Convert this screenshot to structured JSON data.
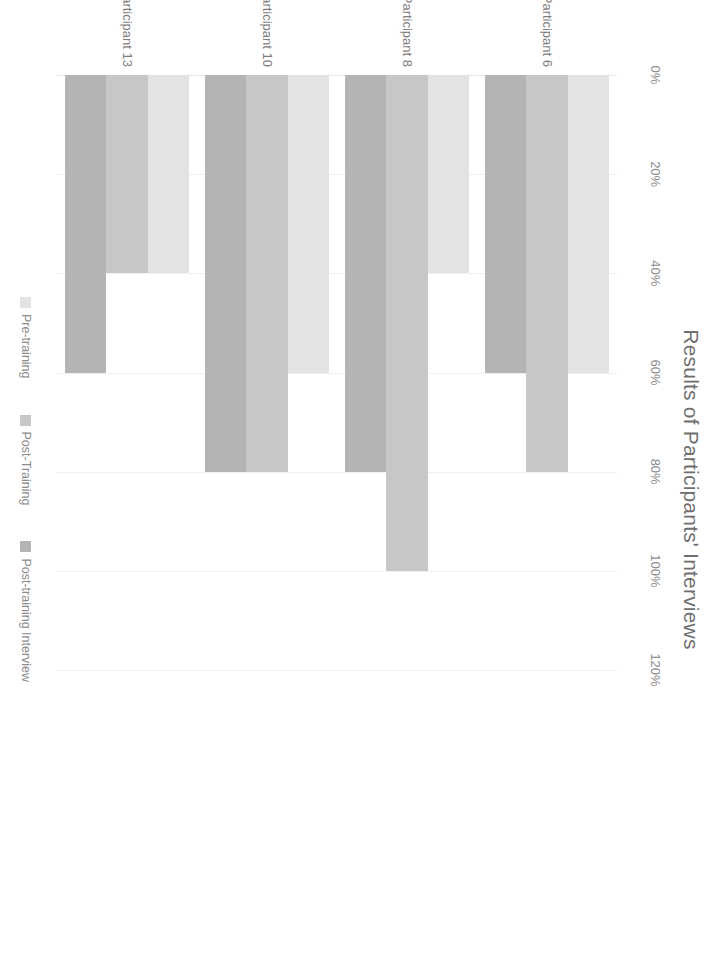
{
  "chart_data": {
    "type": "bar",
    "orientation": "horizontal",
    "title": "Results of Participants' Interviews",
    "xlabel": "",
    "ylabel": "",
    "categories": [
      "Participant 6",
      "Participant 8",
      "Participant 10",
      "Participant 13"
    ],
    "series": [
      {
        "name": "Pre-training",
        "color": "#e3e3e3",
        "values": [
          60,
          40,
          60,
          40
        ]
      },
      {
        "name": "Post-Training",
        "color": "#c7c7c7",
        "values": [
          80,
          100,
          80,
          40
        ]
      },
      {
        "name": "Post-training Interview",
        "color": "#b4b4b4",
        "values": [
          60,
          80,
          80,
          60
        ]
      }
    ],
    "xlim": [
      0,
      120
    ],
    "tick_labels": [
      "0%",
      "20%",
      "40%",
      "60%",
      "80%",
      "100%",
      "120%"
    ],
    "tick_values": [
      0,
      20,
      40,
      60,
      80,
      100,
      120
    ],
    "grid": true,
    "legend_position": "bottom",
    "value_suffix": "%",
    "note": "Chart is rotated 90 degrees clockwise in the source image; bottom group (Participant 13) is cropped."
  },
  "legend": {
    "items": [
      {
        "label": "Pre-training"
      },
      {
        "label": "Post-Training"
      },
      {
        "label": "Post-training Interview"
      }
    ]
  }
}
